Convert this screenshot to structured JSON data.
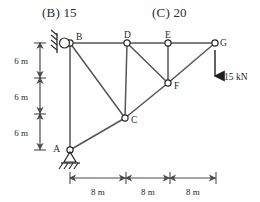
{
  "options": {
    "b": "(B) 15",
    "c": "(C) 20"
  },
  "figure": {
    "type": "truss-diagram",
    "nodes": [
      {
        "id": "A",
        "label": "A",
        "x": 70,
        "y": 150,
        "support": "pin"
      },
      {
        "id": "B",
        "label": "B",
        "x": 70,
        "y": 43,
        "support": "pin"
      },
      {
        "id": "C",
        "label": "C",
        "x": 125,
        "y": 118,
        "support": "none"
      },
      {
        "id": "D",
        "label": "D",
        "x": 127,
        "y": 43,
        "support": "none"
      },
      {
        "id": "E",
        "label": "E",
        "x": 168,
        "y": 43,
        "support": "none"
      },
      {
        "id": "F",
        "label": "F",
        "x": 168,
        "y": 83,
        "support": "none"
      },
      {
        "id": "G",
        "label": "G",
        "x": 215,
        "y": 43,
        "support": "none"
      }
    ],
    "members": [
      {
        "from": "B",
        "to": "D"
      },
      {
        "from": "D",
        "to": "E"
      },
      {
        "from": "E",
        "to": "G"
      },
      {
        "from": "A",
        "to": "C"
      },
      {
        "from": "C",
        "to": "F"
      },
      {
        "from": "F",
        "to": "G"
      },
      {
        "from": "A",
        "to": "B"
      },
      {
        "from": "B",
        "to": "C"
      },
      {
        "from": "D",
        "to": "C"
      },
      {
        "from": "D",
        "to": "F"
      },
      {
        "from": "E",
        "to": "F"
      }
    ],
    "load": {
      "label": "15 kN",
      "at_node": "G",
      "direction": "down",
      "magnitude": 15,
      "unit": "kN"
    },
    "vertical_dimensions": [
      {
        "label": "6 m",
        "value": 6,
        "unit": "m"
      },
      {
        "label": "6 m",
        "value": 6,
        "unit": "m"
      },
      {
        "label": "6 m",
        "value": 6,
        "unit": "m"
      }
    ],
    "horizontal_dimensions": [
      {
        "label": "8 m",
        "value": 8,
        "unit": "m"
      },
      {
        "label": "8 m",
        "value": 8,
        "unit": "m"
      },
      {
        "label": "8 m",
        "value": 8,
        "unit": "m"
      }
    ],
    "colors": {
      "member": "#555555",
      "node_stroke": "#2a2a2a",
      "node_fill": "#ffffff",
      "dimension": "#4a4a4a",
      "text": "#1f1f1f"
    }
  }
}
